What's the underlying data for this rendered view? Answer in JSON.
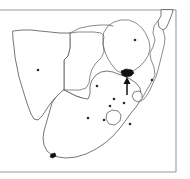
{
  "figure": {
    "title": "Southern Africa distribution map",
    "type": "map",
    "frame_color": "#9a9a9a",
    "coastline_color": "#4a4a4a",
    "border_color": "#5a5a5a",
    "marker_color": "#111111",
    "background_color": "#ffffff"
  },
  "map": {
    "region_label": "Southern Africa",
    "countries": [
      {
        "name": "Namibia"
      },
      {
        "name": "Botswana"
      },
      {
        "name": "Zimbabwe"
      },
      {
        "name": "Mozambique"
      },
      {
        "name": "South Africa"
      },
      {
        "name": "Lesotho"
      },
      {
        "name": "Swaziland"
      }
    ],
    "city_dots": [
      {
        "name": "dot-namibia",
        "x": 38,
        "y": 70
      },
      {
        "name": "dot-zimbabwe",
        "x": 135,
        "y": 40
      },
      {
        "name": "dot-limpopo",
        "x": 97,
        "y": 86
      },
      {
        "name": "dot-gauteng",
        "x": 114,
        "y": 99
      },
      {
        "name": "dot-freestate-north",
        "x": 124,
        "y": 103
      },
      {
        "name": "dot-freestate-south",
        "x": 110,
        "y": 106
      },
      {
        "name": "dot-northern-cape",
        "x": 88,
        "y": 118
      },
      {
        "name": "dot-eastern-cape",
        "x": 104,
        "y": 120
      },
      {
        "name": "dot-kwazulu",
        "x": 130,
        "y": 124
      },
      {
        "name": "dot-mpumalanga",
        "x": 152,
        "y": 80
      }
    ],
    "locality_markers": [
      {
        "name": "highlighted-locality",
        "x": 127,
        "y": 74
      },
      {
        "name": "cape-locality",
        "x": 53,
        "y": 156
      }
    ],
    "pointer": {
      "name": "arrow-pointer",
      "tip_x": 127,
      "tip_y": 78,
      "tail_x": 127,
      "tail_y": 95,
      "direction": "up"
    }
  }
}
